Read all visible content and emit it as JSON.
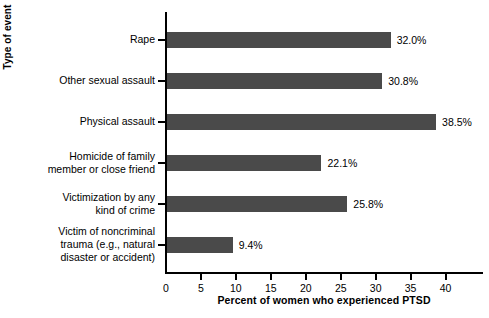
{
  "chart_data": {
    "type": "bar",
    "orientation": "horizontal",
    "title": "",
    "xlabel": "Percent of women who experienced PTSD",
    "ylabel": "Type of event",
    "categories": [
      "Rape",
      "Other sexual assault",
      "Physical assault",
      "Homicide of family\nmember or close friend",
      "Victimization by any\nkind of crime",
      "Victim of noncriminal\ntrauma (e.g., natural\ndisaster or accident)"
    ],
    "values": [
      32.0,
      30.8,
      38.5,
      22.1,
      25.8,
      9.4
    ],
    "value_labels": [
      "32.0%",
      "30.8%",
      "38.5%",
      "22.1%",
      "25.8%",
      "9.4%"
    ],
    "xlim": [
      0,
      45.5
    ],
    "xticks": [
      0,
      5,
      10,
      15,
      20,
      25,
      30,
      35,
      40
    ],
    "xtick_labels": [
      "0",
      "5",
      "10",
      "15",
      "20",
      "25",
      "30",
      "35",
      "40"
    ],
    "grid": false,
    "legend": false,
    "bar_color": "#4a4a4a",
    "axis_color": "#000000",
    "background_color": "#ffffff"
  }
}
